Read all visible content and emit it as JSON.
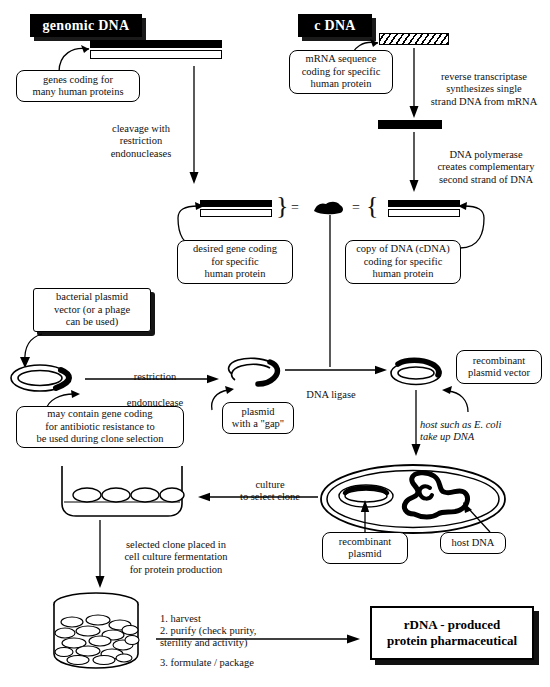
{
  "diagram": {
    "ink_color": "#000000",
    "background_color": "#ffffff"
  },
  "headers": {
    "genomic_dna": "genomic DNA",
    "cdna": "c DNA"
  },
  "callouts": {
    "genes_coding": "genes coding for\nmany human proteins",
    "mrna_sequence": "mRNA sequence\ncoding for specific\nhuman protein",
    "desired_gene": "desired gene coding\nfor specific\nhuman protein",
    "copy_of_dna": "copy of DNA (cDNA)\ncoding for specific\nhuman protein",
    "bacterial_plasmid": "bacterial plasmid\nvector (or a phage\ncan be used)",
    "may_contain_gene": "may contain gene coding\nfor antibiotic resistance to\nbe used during clone selection",
    "plasmid_gap": "plasmid\nwith a \"gap\"",
    "recombinant_plasmid_vector": "recombinant\nplasmid vector",
    "recombinant_plasmid": "recombinant\nplasmid",
    "host_dna": "host DNA"
  },
  "process_labels": {
    "cleavage": "cleavage with\nrestriction\nendonucleases",
    "reverse_transcriptase": "reverse transcriptase\nsynthesizes single\nstrand DNA from mRNA",
    "dna_polymerase": "DNA polymerase\ncreates complementary\nsecond strand of DNA",
    "restriction_endonuclease_line1": "restriction",
    "restriction_endonuclease_line2": "endonuclease",
    "dna_ligase": "DNA ligase",
    "host_uptake": "host such as E. coli\ntake up DNA",
    "culture_select": "culture\nto select clone",
    "selected_clone": "selected clone placed in\ncell culture fermentation\nfor protein production"
  },
  "downstream_steps": {
    "step1": "1. harvest",
    "step2": "2. purify (check purity,\n    sterility and activity)",
    "step3": "3. formulate / package"
  },
  "final_product": {
    "label": "rDNA - produced\nprotein pharmaceutical"
  },
  "symbols": {
    "equals_left": "=",
    "equals_right": "=",
    "brace_left": "}",
    "brace_right": "{"
  }
}
